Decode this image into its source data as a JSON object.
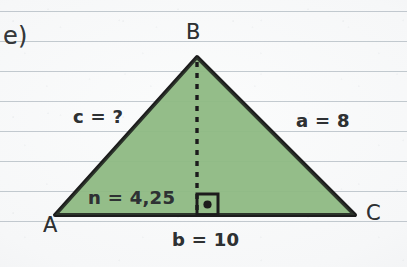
{
  "figure": {
    "exercise_label": "e)",
    "background": {
      "kind": "lined-notebook-paper-scan",
      "paper_color": "#f6f7f8",
      "rule_line_color": "#96a2ac",
      "rule_spacing_px": 30
    },
    "shape": {
      "kind": "triangle",
      "fill_color": "#93bd87",
      "stroke_color": "#1c1c1c",
      "stroke_width_px": 4,
      "vertices": [
        {
          "name": "A",
          "x": 55,
          "y": 215
        },
        {
          "name": "B",
          "x": 197,
          "y": 57
        },
        {
          "name": "C",
          "x": 355,
          "y": 215
        }
      ]
    },
    "altitude": {
      "kind": "dashed-height-line",
      "from_vertex": "B",
      "foot_x": 197,
      "foot_y": 215,
      "stroke_color": "#1c1c1c",
      "dash_pattern": "5 6"
    },
    "right_angle_marker": {
      "kind": "square-with-center-dot",
      "x": 196,
      "y": 193,
      "size_px": 22,
      "stroke_color": "#1c1c1c"
    },
    "vertex_labels": {
      "a": "A",
      "b": "B",
      "c": "C"
    },
    "measurements": {
      "side_c": "c = ?",
      "side_a": "a = 8",
      "side_b": "b = 10",
      "segment_n": "n = 4,25"
    }
  }
}
